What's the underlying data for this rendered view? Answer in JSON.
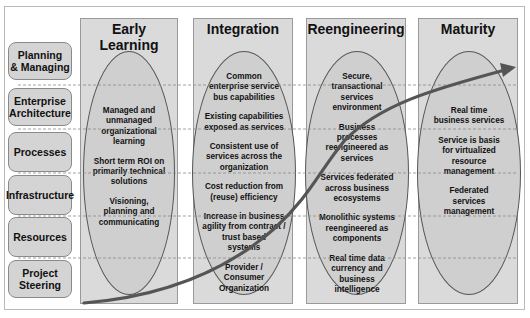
{
  "rows": [
    {
      "label": "Planning\n& Managing"
    },
    {
      "label": "Enterprise\nArchitecture"
    },
    {
      "label": "Processes"
    },
    {
      "label": "Infrastructure"
    },
    {
      "label": "Resources"
    },
    {
      "label": "Project\nSteering"
    }
  ],
  "columns": [
    {
      "title": "Early Learning",
      "items": [
        "Managed and\nunmanaged\norganizational\nlearning",
        "Short term ROI on\nprimarily technical\nsolutions",
        "Visioning,\nplanning and\ncommunicating"
      ]
    },
    {
      "title": "Integration",
      "items": [
        "Common\nenterprise service\nbus capabilities",
        "Existing capabilities\nexposed as services",
        "Consistent use of\nservices across the\norganization",
        "Cost reduction from\n(reuse) efficiency",
        "Increase in business\nagility from contract /\ntrust based\nsystems",
        "Provider /\nConsumer\nOrganization"
      ]
    },
    {
      "title": "Reengineering",
      "items": [
        "Secure,\ntransactional\nservices\nenvironment",
        "Business\nprocesses\nreengineered as\nservices",
        "Services federated\nacross business\necosystems",
        "Monolithic systems\nreengineered as\ncomponents",
        "Real time data\ncurrency and\nbusiness\nintelligence"
      ]
    },
    {
      "title": "Maturity",
      "items": [
        "Real time\nbusiness services",
        "Service is basis\nfor virtualized\nresource\nmanagement",
        "Federated\nservices\nmanagement"
      ]
    }
  ],
  "colors": {
    "column_fill": "#dadada",
    "ellipse_fill": "#cfcfcf",
    "row_label_fill": "#d4d4d4",
    "curve": "#555555",
    "dashed_line": "#8a8a8a"
  }
}
